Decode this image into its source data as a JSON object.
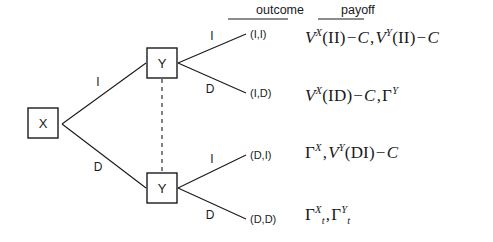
{
  "diagram": {
    "columns": {
      "outcome_header": "outcome",
      "payoff_header": "payoff"
    },
    "nodes": [
      {
        "id": "root",
        "label": "X",
        "player": "X"
      },
      {
        "id": "y-top",
        "label": "Y",
        "player": "Y"
      },
      {
        "id": "y-bottom",
        "label": "Y",
        "player": "Y"
      }
    ],
    "information_set": {
      "style": "dashed",
      "connects": [
        "y-top",
        "y-bottom"
      ]
    },
    "edges": [
      {
        "from": "root",
        "to": "y-top",
        "label": "I"
      },
      {
        "from": "root",
        "to": "y-bottom",
        "label": "D"
      },
      {
        "from": "y-top",
        "to": "leaf-II",
        "label": "I"
      },
      {
        "from": "y-top",
        "to": "leaf-ID",
        "label": "D"
      },
      {
        "from": "y-bottom",
        "to": "leaf-DI",
        "label": "I"
      },
      {
        "from": "y-bottom",
        "to": "leaf-DD",
        "label": "D"
      }
    ],
    "rows": [
      {
        "outcome": "(I,I)"
      },
      {
        "outcome": "(I,D)"
      },
      {
        "outcome": "(D,I)"
      },
      {
        "outcome": "(D,D)"
      }
    ],
    "payoffs": [
      {
        "id": "payoff-II",
        "x_term": {
          "symbol": "V",
          "sup": "X",
          "arg": "(II)",
          "minus": "C"
        },
        "y_term": {
          "symbol": "V",
          "sup": "Y",
          "arg": "(II)",
          "minus": "C"
        },
        "plain": "V^X(II) - C, V^Y(II) - C"
      },
      {
        "id": "payoff-ID",
        "x_term": {
          "symbol": "V",
          "sup": "X",
          "arg": "(ID)",
          "minus": "C"
        },
        "y_term": {
          "symbol": "Γ",
          "sup": "Y",
          "arg": "",
          "minus": ""
        },
        "plain": "V^X(ID) - C, Γ^Y"
      },
      {
        "id": "payoff-DI",
        "x_term": {
          "symbol": "Γ",
          "sup": "X",
          "arg": "",
          "minus": ""
        },
        "y_term": {
          "symbol": "V",
          "sup": "Y",
          "arg": "(DI)",
          "minus": "C"
        },
        "plain": "Γ^X, V^Y(DI) - C"
      },
      {
        "id": "payoff-DD",
        "x_term": {
          "symbol": "Γ",
          "sup": "X",
          "sub": "t",
          "arg": "",
          "minus": ""
        },
        "y_term": {
          "symbol": "Γ",
          "sup": "Y",
          "sub": "t",
          "arg": "",
          "minus": ""
        },
        "plain": "Γ_t^X, Γ_t^Y"
      }
    ],
    "glyphs": {
      "gamma": "Γ",
      "V": "V",
      "C": "C",
      "minus": "−",
      "comma": ","
    },
    "colors": {
      "stroke": "#1a1a1a",
      "text": "#1a1a1a",
      "background": "#ffffff"
    }
  }
}
